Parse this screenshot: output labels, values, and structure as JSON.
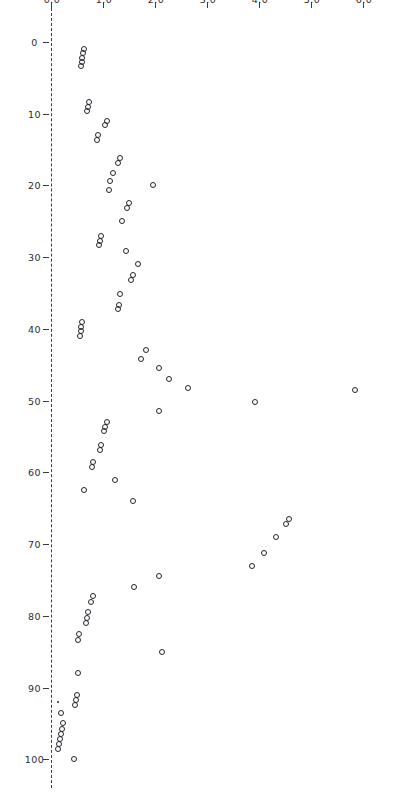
{
  "figure": {
    "title": "",
    "rotation_degrees": 90,
    "background_color": "#ffffff",
    "marker_color": "#25252e",
    "axis_color": "#3a3a44"
  },
  "chart_data": {
    "type": "scatter",
    "title": "",
    "subtitle": "",
    "xlabel": "",
    "ylabel": "",
    "xlim": [
      0,
      104
    ],
    "ylim": [
      0,
      6.4
    ],
    "grid": false,
    "legend": null,
    "annotations": [],
    "xticks": [
      0,
      10,
      20,
      30,
      40,
      50,
      60,
      70,
      80,
      90,
      100
    ],
    "xticklabels": [
      "0",
      "10",
      "20",
      "30",
      "40",
      "50",
      "60",
      "70",
      "80",
      "90",
      "100"
    ],
    "yticks": [
      0.0,
      1.0,
      2.0,
      3.0,
      4.0,
      5.0,
      6.0
    ],
    "yticklabels": [
      "0.0",
      "1.0",
      "2.0",
      "3.0",
      "4.0",
      "5.0",
      "6.0"
    ],
    "marker": "open-circle",
    "series": [
      {
        "name": "points",
        "x": [
          1.0,
          1.6,
          2.2,
          2.8,
          3.4,
          8.4,
          9.0,
          9.6,
          11.0,
          11.6,
          13.0,
          13.7,
          16.2,
          16.8,
          18.2,
          19.4,
          20.0,
          20.6,
          22.5,
          23.1,
          25.0,
          27.0,
          27.7,
          28.3,
          29.2,
          31.0,
          32.5,
          33.2,
          35.2,
          36.6,
          37.2,
          39.0,
          39.7,
          40.3,
          41.0,
          43.0,
          44.2,
          45.5,
          47.0,
          48.3,
          50.2,
          51.5,
          53.0,
          53.7,
          54.3,
          56.2,
          56.9,
          58.5,
          59.2,
          61.0,
          62.4,
          64.0,
          66.5,
          67.2,
          69.0,
          71.3,
          73.0,
          74.5,
          76.0,
          77.2,
          78.0,
          79.5,
          80.3,
          81.0,
          82.5,
          83.4,
          85.0,
          88.0,
          91.0,
          91.7,
          92.4,
          93.5,
          95.0,
          95.8,
          96.5,
          97.2,
          97.9,
          98.6,
          100.0
        ],
        "y": [
          0.62,
          0.6,
          0.58,
          0.57,
          0.55,
          0.72,
          0.7,
          0.68,
          1.05,
          1.02,
          0.88,
          0.86,
          1.3,
          1.26,
          1.18,
          1.12,
          1.95,
          1.1,
          1.48,
          1.44,
          1.35,
          0.95,
          0.92,
          0.9,
          1.42,
          1.65,
          1.55,
          1.52,
          1.3,
          1.28,
          1.26,
          0.58,
          0.56,
          0.55,
          0.54,
          1.8,
          1.72,
          2.05,
          2.25,
          2.62,
          3.9,
          2.05,
          1.05,
          1.02,
          1.0,
          0.95,
          0.92,
          0.78,
          0.76,
          1.22,
          0.62,
          1.55,
          4.55,
          4.5,
          4.3,
          4.08,
          3.85,
          2.05,
          1.58,
          0.78,
          0.75,
          0.7,
          0.68,
          0.66,
          0.52,
          0.5,
          2.12,
          0.5,
          0.48,
          0.46,
          0.44,
          0.18,
          0.22,
          0.2,
          0.18,
          0.16,
          0.14,
          0.12,
          0.42
        ]
      }
    ]
  },
  "left_outlier": {
    "x": 48.5,
    "y": 5.82,
    "note": "isolated high point"
  },
  "tiny_point": {
    "x": 92.0,
    "y": 0.12,
    "note": "small filled dot"
  }
}
